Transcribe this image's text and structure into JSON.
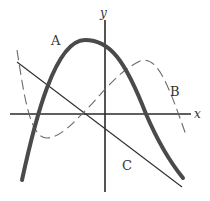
{
  "diagram": {
    "type": "function-graphs-on-cartesian-axes",
    "axes": {
      "x_label": "x",
      "y_label": "y"
    },
    "curves": [
      {
        "label": "A",
        "style": "thick solid",
        "shape": "downward parabola"
      },
      {
        "label": "B",
        "style": "dashed",
        "shape": "cubic"
      },
      {
        "label": "C",
        "style": "thin solid",
        "shape": "decreasing line"
      }
    ],
    "colors": {
      "axis": "#2a2a2a",
      "curve_a": "#4a4a4a",
      "curve_b": "#6a6a6a",
      "curve_c": "#2e2e2e"
    }
  }
}
